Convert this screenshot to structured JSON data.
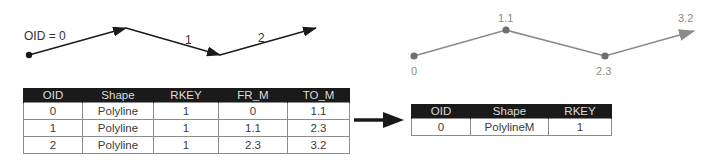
{
  "left_diagram": {
    "oid_label": "OID = 0",
    "segment_labels": [
      "1",
      "2"
    ],
    "style": {
      "line_color": "#1a1a1a"
    }
  },
  "right_diagram": {
    "measure_labels": [
      "0",
      "1.1",
      "2.3",
      "3.2"
    ],
    "style": {
      "line_color": "#8a8a8a",
      "point_color": "#6e6e6e",
      "label_color": "#8a8a8a"
    }
  },
  "transform_arrow": {
    "icon": "right-arrow-icon",
    "color": "#1a1a1a"
  },
  "left_table": {
    "headers": [
      "OID",
      "Shape",
      "RKEY",
      "FR_M",
      "TO_M"
    ],
    "rows": [
      [
        "0",
        "Polyline",
        "1",
        "0",
        "1.1"
      ],
      [
        "1",
        "Polyline",
        "1",
        "1.1",
        "2.3"
      ],
      [
        "2",
        "Polyline",
        "1",
        "2.3",
        "3.2"
      ]
    ]
  },
  "right_table": {
    "headers": [
      "OID",
      "Shape",
      "RKEY"
    ],
    "rows": [
      [
        "0",
        "PolylineM",
        "1"
      ]
    ]
  }
}
